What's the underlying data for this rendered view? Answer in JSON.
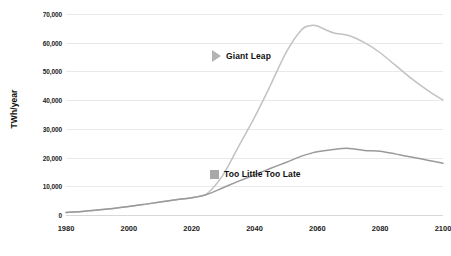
{
  "chart_data": {
    "type": "line",
    "title": "",
    "subtitle": "",
    "xlabel": "",
    "ylabel": "TWh/year",
    "xlim": [
      1980,
      2100
    ],
    "ylim": [
      0,
      70000
    ],
    "grid": true,
    "legend_position": "inline-annotation",
    "x_ticks": [
      "1980",
      "2000",
      "2020",
      "2040",
      "2060",
      "2080",
      "2100"
    ],
    "x_tick_values": [
      1980,
      2000,
      2020,
      2040,
      2060,
      2080,
      2100
    ],
    "y_ticks": [
      "0",
      "10,000",
      "20,000",
      "30,000",
      "40,000",
      "50,000",
      "60,000",
      "70,000"
    ],
    "y_tick_values": [
      0,
      10000,
      20000,
      30000,
      40000,
      50000,
      60000,
      70000
    ],
    "x": [
      1980,
      1985,
      1990,
      1995,
      2000,
      2005,
      2010,
      2015,
      2020,
      2022,
      2025,
      2030,
      2035,
      2040,
      2045,
      2050,
      2055,
      2058,
      2060,
      2065,
      2070,
      2075,
      2080,
      2085,
      2090,
      2095,
      2100
    ],
    "series": [
      {
        "name": "Giant Leap",
        "color": "#c2c2c2",
        "marker": "triangle",
        "values": [
          900,
          1200,
          1700,
          2300,
          3000,
          3700,
          4500,
          5300,
          6000,
          6400,
          7500,
          14000,
          24000,
          34000,
          45000,
          56500,
          64500,
          66000,
          65800,
          63500,
          62500,
          60000,
          56500,
          52000,
          47500,
          43500,
          40000
        ]
      },
      {
        "name": "Too Little Too Late",
        "color": "#9a9a9a",
        "marker": "square",
        "values": [
          900,
          1200,
          1700,
          2300,
          3000,
          3700,
          4500,
          5300,
          6000,
          6400,
          7200,
          9500,
          11800,
          14000,
          16200,
          18300,
          20500,
          21500,
          22000,
          22800,
          23200,
          22500,
          22200,
          21200,
          20200,
          19100,
          18000
        ]
      }
    ],
    "annotations": [
      {
        "label": "Giant Leap",
        "marker": "triangle",
        "color": "#b3b3b3"
      },
      {
        "label": "Too Little Too Late",
        "marker": "square",
        "color": "#a8a8a8"
      }
    ]
  }
}
